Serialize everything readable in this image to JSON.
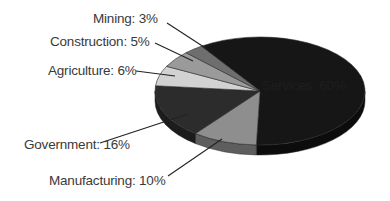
{
  "chart_data": {
    "type": "pie",
    "title": "",
    "style": "3d-exploded-none",
    "categories": [
      "Services",
      "Manufacturing",
      "Government",
      "Agriculture",
      "Construction",
      "Mining"
    ],
    "values": [
      60,
      10,
      16,
      6,
      5,
      3
    ],
    "unit": "%",
    "labels": [
      "Services: 60%",
      "Manufacturing: 10%",
      "Government: 16%",
      "Agriculture: 6%",
      "Construction: 5%",
      "Mining: 3%"
    ],
    "colors": [
      "#161616",
      "#8e8e8e",
      "#2c2c2c",
      "#d2d2d2",
      "#9a9a9a",
      "#6e6e6e"
    ],
    "side_colors": [
      "#0c0c0c",
      "#5e5e5e",
      "#1c1c1c",
      "#9a9a9a",
      "#6a6a6a",
      "#4a4a4a"
    ],
    "legend": "none (leader-line labels)"
  },
  "labels": {
    "services": "Services: 60%",
    "manufacturing": "Manufacturing: 10%",
    "government": "Government: 16%",
    "agriculture": "Agriculture: 6%",
    "construction": "Construction: 5%",
    "mining": "Mining: 3%"
  }
}
